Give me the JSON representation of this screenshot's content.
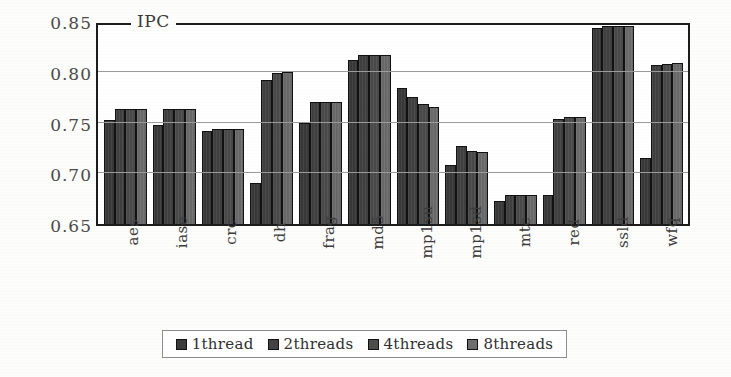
{
  "chart_data": {
    "type": "bar",
    "title": "IPC",
    "xlabel": "",
    "ylabel": "IPC",
    "ylim": [
      0.65,
      0.85
    ],
    "yticks": [
      0.65,
      0.7,
      0.75,
      0.8,
      0.85
    ],
    "ytick_labels": [
      "0.65",
      "0.70",
      "0.75",
      "0.80",
      "0.85"
    ],
    "grid": true,
    "legend_position": "bottom",
    "categories": [
      "aes",
      "iase",
      "crc",
      "dh",
      "frag",
      "md5",
      "mp1su",
      "mp1sd",
      "mtc",
      "red",
      "ssld",
      "wfq"
    ],
    "series": [
      {
        "name": "1thread",
        "color": "#3b3b3b",
        "values": [
          0.752,
          0.748,
          0.742,
          0.69,
          0.75,
          0.812,
          0.784,
          0.708,
          0.673,
          0.679,
          0.843,
          0.715
        ]
      },
      {
        "name": "2threads",
        "color": "#434343",
        "values": [
          0.763,
          0.763,
          0.744,
          0.792,
          0.77,
          0.817,
          0.775,
          0.727,
          0.679,
          0.753,
          0.845,
          0.807
        ]
      },
      {
        "name": "4threads",
        "color": "#4d4d4d",
        "values": [
          0.763,
          0.763,
          0.744,
          0.799,
          0.77,
          0.817,
          0.768,
          0.722,
          0.679,
          0.755,
          0.845,
          0.808
        ]
      },
      {
        "name": "8threads",
        "color": "#6e6e6e",
        "values": [
          0.763,
          0.763,
          0.744,
          0.8,
          0.77,
          0.817,
          0.765,
          0.721,
          0.679,
          0.755,
          0.845,
          0.809
        ]
      }
    ]
  },
  "legend": {
    "items": [
      {
        "label": "1thread"
      },
      {
        "label": "2threads"
      },
      {
        "label": "4threads"
      },
      {
        "label": "8threads"
      }
    ]
  },
  "colors": {
    "axis": "#1c1c1c",
    "grid": "#9a9a9a",
    "background": "#fdfdfb",
    "text": "#3c3c3c"
  }
}
